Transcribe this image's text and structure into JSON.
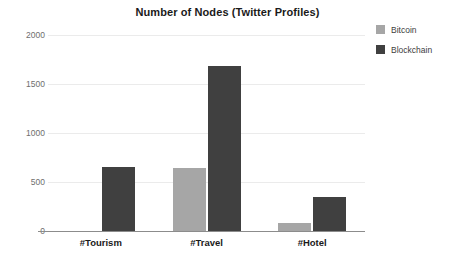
{
  "chart_data": {
    "type": "bar",
    "title": "Number of Nodes (Twitter Profiles)",
    "xlabel": "",
    "ylabel": "",
    "categories": [
      "#Tourism",
      "#Travel",
      "#Hotel"
    ],
    "series": [
      {
        "name": "Bitcoin",
        "color": "#a6a6a6",
        "values": [
          0,
          640,
          80
        ]
      },
      {
        "name": "Blockchain",
        "color": "#404040",
        "values": [
          650,
          1680,
          350
        ]
      }
    ],
    "ylim": [
      0,
      2000
    ],
    "yticks": [
      0,
      500,
      1000,
      1500,
      2000
    ],
    "ytick_labels": [
      "0",
      "500",
      "1000",
      "1500",
      "2000"
    ],
    "grid": true,
    "legend_position": "right"
  },
  "legend": {
    "items": [
      {
        "label": "Bitcoin",
        "color": "#a6a6a6"
      },
      {
        "label": "Blockchain",
        "color": "#404040"
      }
    ]
  },
  "colors": {
    "background": "#ffffff",
    "gridline": "#ebebeb",
    "axis": "#8c8c8c",
    "title_text": "#1a1a1a",
    "tick_text": "#6e6e6e",
    "category_text": "#1a1a1a"
  }
}
